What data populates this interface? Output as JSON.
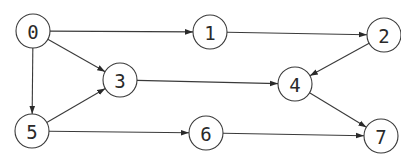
{
  "diagram": {
    "type": "directed-graph",
    "width": 401,
    "height": 155,
    "colors": {
      "background": "#ffffff",
      "stroke": "#3a3a3a",
      "text": "#2a2a2a",
      "node_fill": "#ffffff"
    },
    "node_radius": 17,
    "nodes": [
      {
        "id": "0",
        "label": "0",
        "x": 33,
        "y": 31
      },
      {
        "id": "1",
        "label": "1",
        "x": 210,
        "y": 32
      },
      {
        "id": "2",
        "label": "2",
        "x": 384,
        "y": 35
      },
      {
        "id": "3",
        "label": "3",
        "x": 120,
        "y": 80
      },
      {
        "id": "4",
        "label": "4",
        "x": 295,
        "y": 84
      },
      {
        "id": "5",
        "label": "5",
        "x": 32,
        "y": 131
      },
      {
        "id": "6",
        "label": "6",
        "x": 206,
        "y": 133
      },
      {
        "id": "7",
        "label": "7",
        "x": 381,
        "y": 136
      }
    ],
    "edges": [
      {
        "from": "0",
        "to": "1"
      },
      {
        "from": "0",
        "to": "3"
      },
      {
        "from": "0",
        "to": "5"
      },
      {
        "from": "1",
        "to": "2"
      },
      {
        "from": "2",
        "to": "4"
      },
      {
        "from": "3",
        "to": "4"
      },
      {
        "from": "4",
        "to": "7"
      },
      {
        "from": "5",
        "to": "3"
      },
      {
        "from": "5",
        "to": "6"
      },
      {
        "from": "6",
        "to": "7"
      }
    ]
  }
}
